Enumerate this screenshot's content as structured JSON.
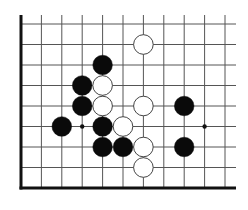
{
  "board": {
    "columns": 11,
    "rows": 9,
    "origin_x": 21,
    "origin_y": 24,
    "spacing_x": 20.4,
    "spacing_y": 20.5,
    "top_extension": 9,
    "right_extension": 11,
    "left_edge_thick": true,
    "bottom_edge_thick": true,
    "line_color": "#555555",
    "edge_color": "#111111",
    "star_points": [
      [
        3,
        5
      ],
      [
        9,
        5
      ]
    ],
    "stones": [
      {
        "color": "white",
        "col": 6,
        "row": 1
      },
      {
        "color": "black",
        "col": 4,
        "row": 2
      },
      {
        "color": "black",
        "col": 3,
        "row": 3
      },
      {
        "color": "white",
        "col": 4,
        "row": 3
      },
      {
        "color": "black",
        "col": 3,
        "row": 4
      },
      {
        "color": "white",
        "col": 4,
        "row": 4
      },
      {
        "color": "white",
        "col": 6,
        "row": 4
      },
      {
        "color": "black",
        "col": 8,
        "row": 4
      },
      {
        "color": "black",
        "col": 2,
        "row": 5
      },
      {
        "color": "black",
        "col": 4,
        "row": 5
      },
      {
        "color": "white",
        "col": 5,
        "row": 5
      },
      {
        "color": "black",
        "col": 4,
        "row": 6
      },
      {
        "color": "black",
        "col": 5,
        "row": 6
      },
      {
        "color": "white",
        "col": 6,
        "row": 6
      },
      {
        "color": "black",
        "col": 8,
        "row": 6
      },
      {
        "color": "white",
        "col": 6,
        "row": 7
      }
    ],
    "colors": {
      "black_stone": "#0a0a0a",
      "white_stone": "#ffffff",
      "white_stroke": "#444444"
    }
  }
}
